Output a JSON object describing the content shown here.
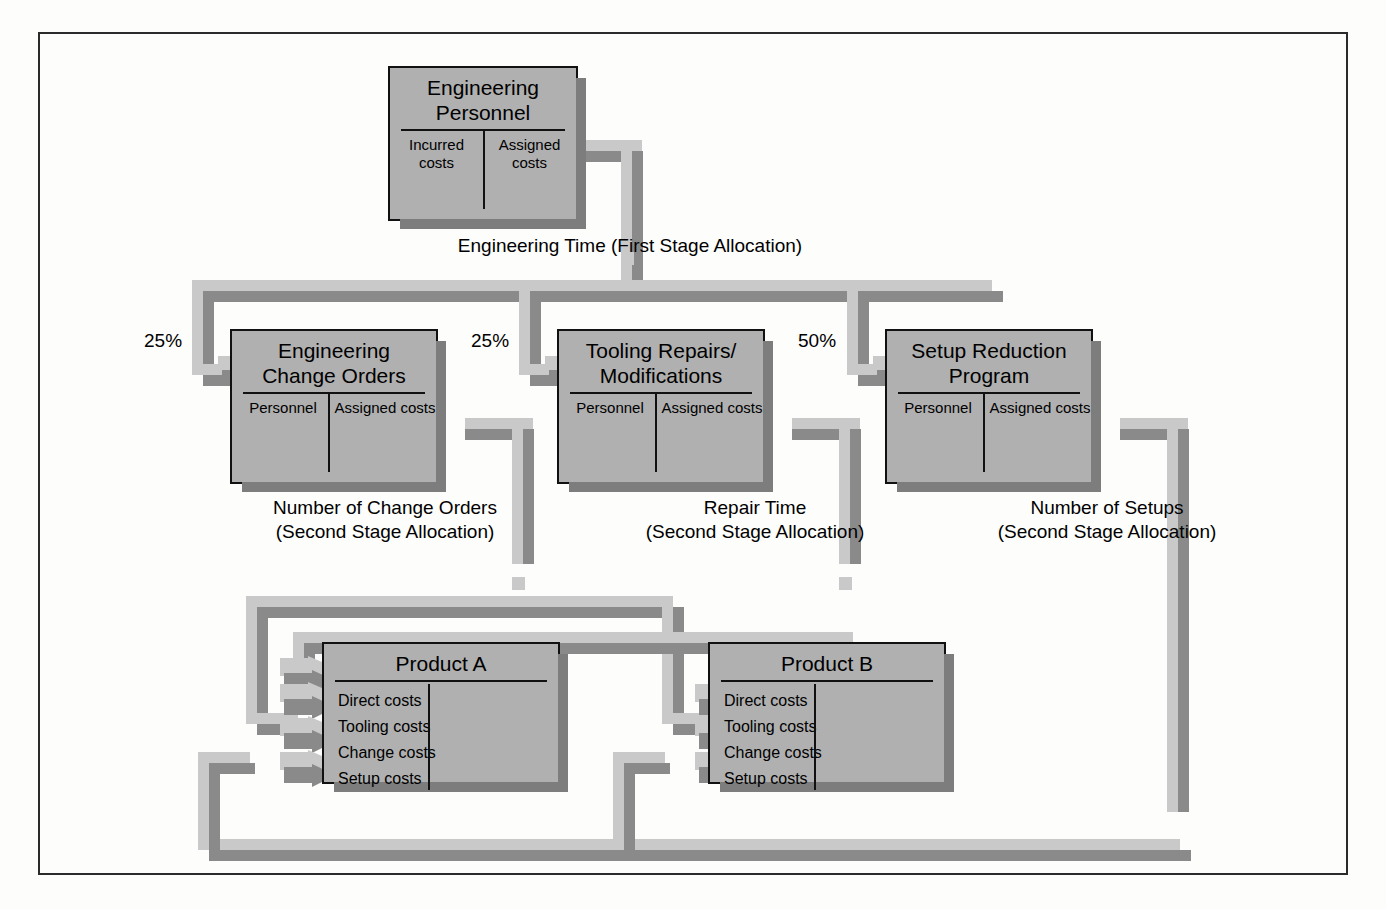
{
  "diagram": {
    "title_text": "",
    "colors": {
      "box_fill": "#b0b0b0",
      "box_border": "#111111",
      "connector_dark": "#8a8a8a",
      "connector_light": "#c9c9c9",
      "shadow": "#7d7d7d",
      "frame_border": "#2b2b2b",
      "page_background": "#fdfdfc"
    },
    "resource": {
      "name": "Engineering Personnel",
      "title_lines": [
        "Engineering",
        "Personnel"
      ],
      "columns": [
        "Incurred costs",
        "Assigned costs"
      ]
    },
    "first_stage_driver": "Engineering Time (First Stage Allocation)",
    "activities": [
      {
        "name": "Engineering Change Orders",
        "title_lines": [
          "Engineering",
          "Change Orders"
        ],
        "columns": [
          "Personnel",
          "Assigned costs"
        ],
        "allocation_pct": "25%",
        "driver_lines": [
          "Number of Change Orders",
          "(Second Stage Allocation)"
        ]
      },
      {
        "name": "Tooling Repairs/Modifications",
        "title_lines": [
          "Tooling Repairs/",
          "Modifications"
        ],
        "columns": [
          "Personnel",
          "Assigned costs"
        ],
        "allocation_pct": "25%",
        "driver_lines": [
          "Repair Time",
          "(Second Stage Allocation)"
        ]
      },
      {
        "name": "Setup Reduction Program",
        "title_lines": [
          "Setup Reduction",
          "Program"
        ],
        "columns": [
          "Personnel",
          "Assigned costs"
        ],
        "allocation_pct": "50%",
        "driver_lines": [
          "Number of Setups",
          "(Second Stage Allocation)"
        ]
      }
    ],
    "products": [
      {
        "name": "Product A",
        "title": "Product A",
        "cost_items": [
          "Direct costs",
          "Tooling costs",
          "Change costs",
          "Setup costs"
        ]
      },
      {
        "name": "Product B",
        "title": "Product B",
        "cost_items": [
          "Direct costs",
          "Tooling costs",
          "Change costs",
          "Setup costs"
        ]
      }
    ]
  }
}
